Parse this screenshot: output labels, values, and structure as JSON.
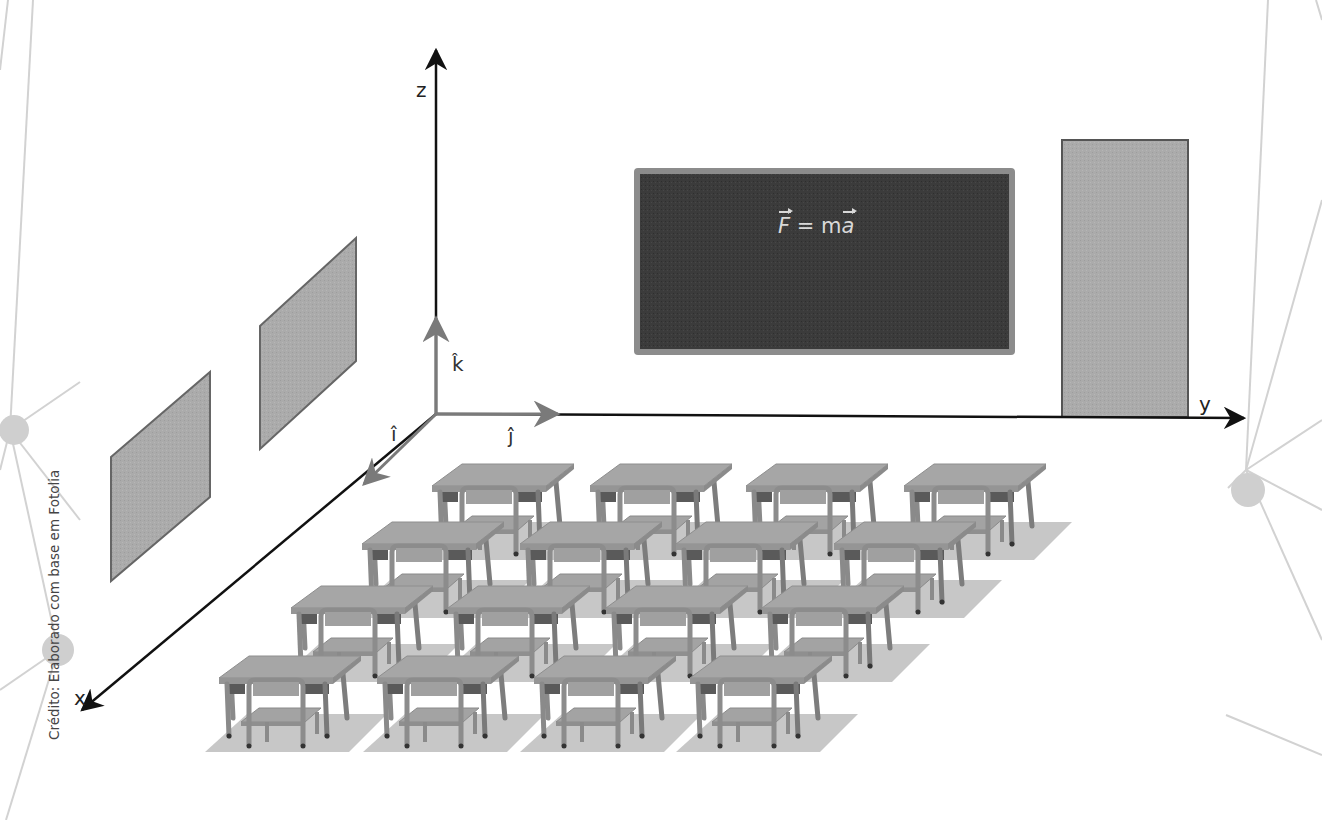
{
  "figure": {
    "type": "classroom-coordinate-system-illustration",
    "credit": "Crédito: Elaborado com base em Fotolia"
  },
  "axes": {
    "x_label": "x",
    "y_label": "y",
    "z_label": "z",
    "unit_vectors": {
      "i": "î",
      "j": "ĵ",
      "k": "k̂"
    },
    "origin_px": [
      436,
      414
    ],
    "colors": {
      "axis": "#111111",
      "unit_vector": "#7a7a7a"
    }
  },
  "blackboard": {
    "formula_lhs": "F",
    "formula_eq": " = m",
    "formula_rhs": "a",
    "colors": {
      "board": "#3a3a3a",
      "frame": "#8c8c8c",
      "chalk": "#d8d8d8"
    }
  },
  "door": {
    "color": "#a9a9a9",
    "border": "#555555"
  },
  "windows": {
    "count": 2,
    "color": "#acacac",
    "border": "#666666"
  },
  "desks": {
    "rows": 4,
    "columns": 4,
    "count": 16
  },
  "decorations": {
    "network_nodes": 3,
    "line_color": "#d0d0d0",
    "node_color": "#cfcfcf"
  }
}
